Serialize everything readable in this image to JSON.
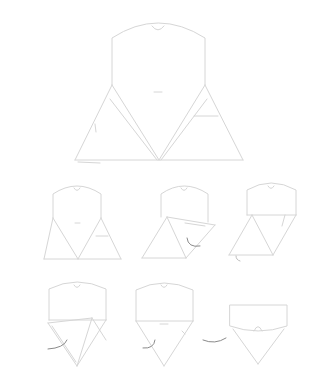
{
  "figure": {
    "title": "",
    "line_color": "#d6d6d6",
    "arrow_color": "#8a8a8a",
    "background": "#ffffff"
  },
  "steps": [
    {
      "id": "step-1",
      "label": "",
      "role": "unfolded template"
    },
    {
      "id": "step-2",
      "label": "",
      "role": "template with crease marks"
    },
    {
      "id": "step-3",
      "label": "",
      "role": "fold right flap inward"
    },
    {
      "id": "step-4",
      "label": "",
      "role": "fold top band down"
    },
    {
      "id": "step-5",
      "label": "",
      "role": "fold left flap over"
    },
    {
      "id": "step-6",
      "label": "",
      "role": "fold sides to point"
    },
    {
      "id": "step-7",
      "label": "",
      "role": "finished pouch with tab tucked"
    }
  ]
}
